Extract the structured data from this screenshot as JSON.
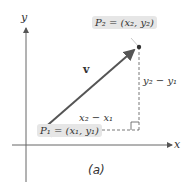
{
  "figure": {
    "caption": "(a)",
    "axes": {
      "x_label": "x",
      "y_label": "y"
    },
    "vector_label": "v",
    "point1_label": "P₁ = (x₁, y₁)",
    "point2_label": "P₂ = (x₂, y₂)",
    "horizontal_leg_label": "x₂ − x₁",
    "vertical_leg_label": "y₂ − y₁",
    "colors": {
      "vector": "#555555",
      "axis": "#555555",
      "label_box": "#e6e6e6"
    }
  }
}
